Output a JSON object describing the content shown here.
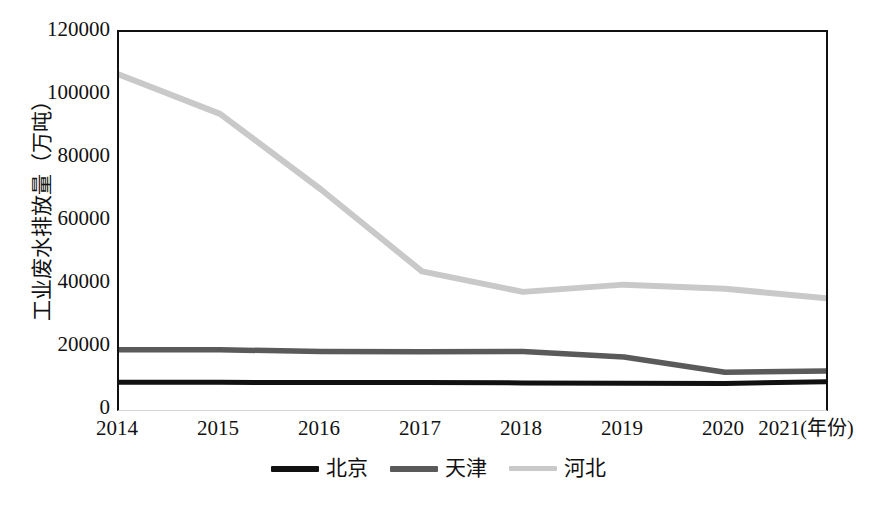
{
  "chart_data": {
    "type": "line",
    "title": "",
    "xlabel": "年份",
    "ylabel": "工业废水排放量（万吨）",
    "x": [
      "2014",
      "2015",
      "2016",
      "2017",
      "2018",
      "2019",
      "2020",
      "2021"
    ],
    "categories": [
      "2014",
      "2015",
      "2016",
      "2017",
      "2018",
      "2019",
      "2020",
      "2021"
    ],
    "xlim": [
      2014,
      2021
    ],
    "ylim": [
      0,
      120000
    ],
    "ytick_labels": [
      "0",
      "20000",
      "40000",
      "60000",
      "80000",
      "100000",
      "120000"
    ],
    "ytick_values": [
      0,
      20000,
      40000,
      60000,
      80000,
      100000,
      120000
    ],
    "grid": false,
    "legend_position": "bottom",
    "series": [
      {
        "name": "北京",
        "color": "#111111",
        "values": [
          8800,
          8800,
          8700,
          8700,
          8600,
          8500,
          8400,
          9000
        ]
      },
      {
        "name": "天津",
        "color": "#5a5a5a",
        "values": [
          19100,
          19100,
          18600,
          18500,
          18600,
          16800,
          12000,
          12400
        ]
      },
      {
        "name": "河北",
        "color": "#c9c9c9",
        "values": [
          106500,
          94000,
          70000,
          44000,
          37500,
          39800,
          38500,
          35500
        ]
      }
    ]
  },
  "axis": {
    "x_unit_label": "(年份)"
  },
  "legend": {
    "items": [
      {
        "label": "北京",
        "color": "#111111"
      },
      {
        "label": "天津",
        "color": "#5a5a5a"
      },
      {
        "label": "河北",
        "color": "#c9c9c9"
      }
    ]
  }
}
